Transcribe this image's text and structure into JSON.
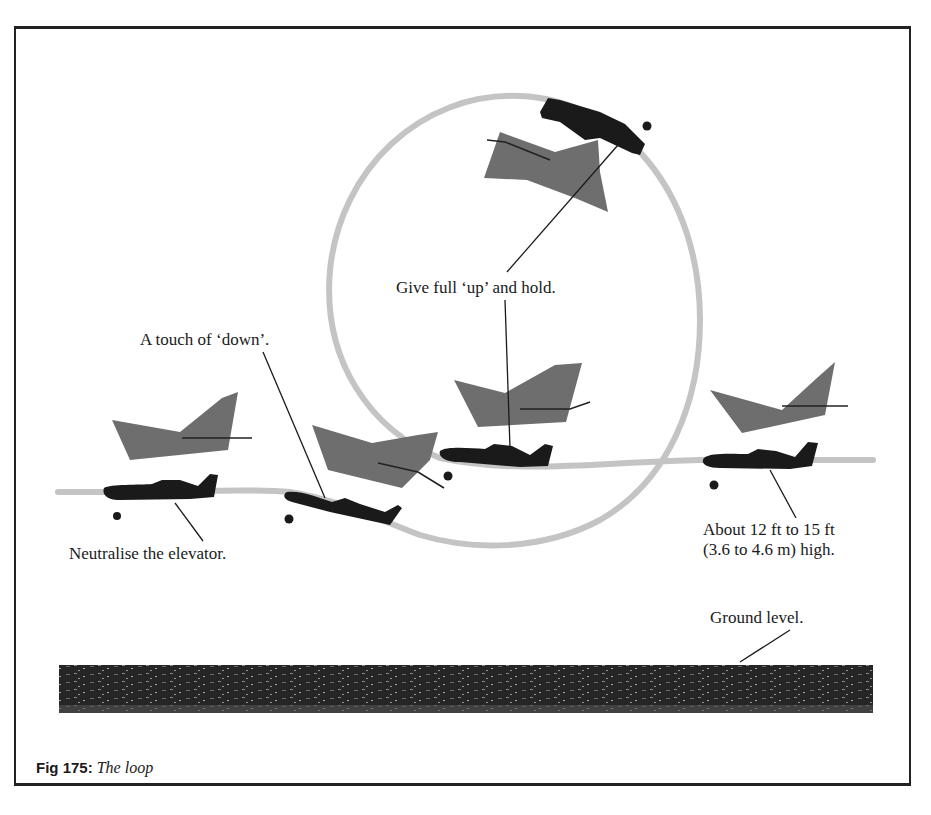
{
  "figure": {
    "number_label": "Fig 175:",
    "title": "The loop"
  },
  "annotations": {
    "give_full_up": "Give full ‘up’ and hold.",
    "touch_of_down": "A touch of ‘down’.",
    "neutralise": "Neutralise the elevator.",
    "height_line1": "About 12 ft to 15 ft",
    "height_line2": "(3.6 to 4.6 m) high.",
    "ground_level": "Ground level."
  },
  "colors": {
    "flight_path": "#c4c4c4",
    "aircraft": "#1a1a1a",
    "shadow_tail": "#6e6e6e",
    "ground": "#2a2a2a",
    "frame": "#222222"
  }
}
